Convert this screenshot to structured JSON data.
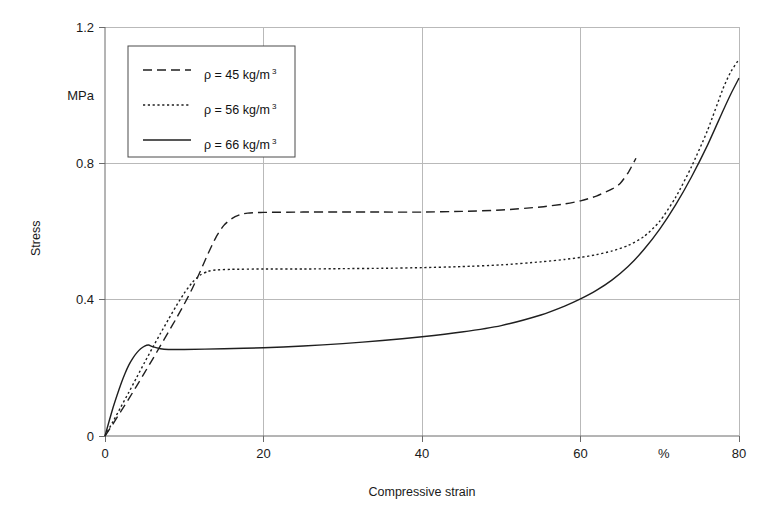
{
  "chart_data": {
    "type": "line",
    "title": "",
    "xlabel": "Compressive strain",
    "ylabel": "Stress",
    "y_unit": "MPa",
    "x_unit": "%",
    "xlim": [
      0,
      80
    ],
    "ylim": [
      0,
      1.2
    ],
    "xticks": [
      0,
      20,
      40,
      60,
      80
    ],
    "xtick_labels": [
      "0",
      "20",
      "40",
      "60",
      "80"
    ],
    "yticks": [
      0,
      0.4,
      0.8,
      1.2
    ],
    "ytick_labels": [
      "0",
      "0.4",
      "0.8",
      "1.2"
    ],
    "grid": true,
    "legend_position": "upper-left",
    "series": [
      {
        "name": "rho-45",
        "label_prefix": "ρ = 45 kg/m",
        "label_sup": "3",
        "style": "dashed",
        "dash_pattern": "9,5",
        "color": "#1f1f1f",
        "x": [
          0,
          1,
          2,
          3,
          4,
          5,
          6,
          7,
          8,
          9,
          10,
          11,
          12,
          13,
          14,
          15,
          16,
          17,
          18,
          20,
          25,
          30,
          35,
          40,
          45,
          50,
          55,
          58,
          60,
          62,
          64,
          65,
          66,
          67
        ],
        "y": [
          0,
          0.035,
          0.072,
          0.109,
          0.147,
          0.186,
          0.225,
          0.265,
          0.305,
          0.345,
          0.387,
          0.432,
          0.482,
          0.535,
          0.583,
          0.618,
          0.638,
          0.649,
          0.654,
          0.656,
          0.657,
          0.657,
          0.657,
          0.657,
          0.659,
          0.663,
          0.672,
          0.681,
          0.69,
          0.704,
          0.725,
          0.741,
          0.772,
          0.815
        ]
      },
      {
        "name": "rho-56",
        "label_prefix": "ρ = 56 kg/m",
        "label_sup": "3",
        "style": "dotted",
        "dash_pattern": "2.2,2.6",
        "color": "#1f1f1f",
        "x": [
          0,
          1,
          2,
          3,
          4,
          5,
          6,
          7,
          8,
          9,
          10,
          11,
          12,
          13,
          14,
          16,
          20,
          25,
          30,
          35,
          40,
          45,
          50,
          55,
          58,
          60,
          62,
          64,
          66,
          68,
          70,
          72,
          74,
          76,
          78,
          79,
          80
        ],
        "y": [
          0,
          0.042,
          0.085,
          0.128,
          0.172,
          0.216,
          0.259,
          0.301,
          0.342,
          0.382,
          0.419,
          0.45,
          0.472,
          0.483,
          0.487,
          0.489,
          0.49,
          0.49,
          0.491,
          0.492,
          0.494,
          0.497,
          0.502,
          0.511,
          0.518,
          0.524,
          0.532,
          0.543,
          0.559,
          0.585,
          0.63,
          0.7,
          0.79,
          0.895,
          1.02,
          1.07,
          1.105
        ]
      },
      {
        "name": "rho-66",
        "label_prefix": "ρ = 66 kg/m",
        "label_sup": "3",
        "style": "solid",
        "dash_pattern": "",
        "color": "#1f1f1f",
        "x": [
          0,
          0.5,
          1,
          1.5,
          2,
          2.5,
          3,
          3.5,
          4,
          4.5,
          5,
          5.5,
          6,
          7,
          8,
          10,
          15,
          20,
          25,
          30,
          35,
          40,
          45,
          50,
          55,
          58,
          60,
          62,
          64,
          66,
          68,
          70,
          72,
          74,
          76,
          78,
          79,
          80
        ],
        "y": [
          0,
          0.042,
          0.082,
          0.118,
          0.152,
          0.182,
          0.208,
          0.228,
          0.244,
          0.256,
          0.264,
          0.267,
          0.262,
          0.256,
          0.254,
          0.254,
          0.256,
          0.259,
          0.264,
          0.271,
          0.28,
          0.291,
          0.305,
          0.324,
          0.355,
          0.381,
          0.402,
          0.427,
          0.458,
          0.497,
          0.547,
          0.607,
          0.678,
          0.76,
          0.852,
          0.955,
          1.005,
          1.05
        ]
      }
    ]
  },
  "legend": {
    "entries": [
      {
        "label_prefix": "ρ = 45 kg/m",
        "label_sup": "3",
        "style": "dashed"
      },
      {
        "label_prefix": "ρ = 56 kg/m",
        "label_sup": "3",
        "style": "dotted"
      },
      {
        "label_prefix": "ρ = 66 kg/m",
        "label_sup": "3",
        "style": "solid"
      }
    ]
  }
}
